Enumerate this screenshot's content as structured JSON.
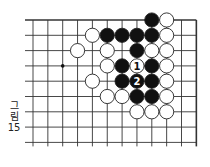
{
  "figure": {
    "caption_lines": [
      "그",
      "림",
      "15"
    ],
    "caption": "그림 15"
  },
  "board": {
    "grid": {
      "x0": 33,
      "y0": 20,
      "dx": 14.85,
      "dy": 15.3,
      "cols": 12,
      "rows": 9,
      "top_edge": true,
      "right_edge": true,
      "line_color": "#333333"
    },
    "star_points": [
      {
        "col": 2,
        "row": 3
      }
    ],
    "stones": [
      {
        "col": 8,
        "row": 0,
        "color": "black"
      },
      {
        "col": 9,
        "row": 0,
        "color": "white"
      },
      {
        "col": 4,
        "row": 1,
        "color": "white"
      },
      {
        "col": 5,
        "row": 1,
        "color": "black"
      },
      {
        "col": 6,
        "row": 1,
        "color": "black"
      },
      {
        "col": 7,
        "row": 1,
        "color": "black"
      },
      {
        "col": 8,
        "row": 1,
        "color": "black"
      },
      {
        "col": 9,
        "row": 1,
        "color": "white"
      },
      {
        "col": 3,
        "row": 2,
        "color": "white"
      },
      {
        "col": 5,
        "row": 2,
        "color": "white"
      },
      {
        "col": 7,
        "row": 2,
        "color": "black"
      },
      {
        "col": 8,
        "row": 2,
        "color": "white"
      },
      {
        "col": 9,
        "row": 2,
        "color": "white"
      },
      {
        "col": 5,
        "row": 3,
        "color": "white"
      },
      {
        "col": 6,
        "row": 3,
        "color": "black"
      },
      {
        "col": 7,
        "row": 3,
        "color": "white",
        "label": "1"
      },
      {
        "col": 8,
        "row": 3,
        "color": "black"
      },
      {
        "col": 9,
        "row": 3,
        "color": "white"
      },
      {
        "col": 4,
        "row": 4,
        "color": "white"
      },
      {
        "col": 6,
        "row": 4,
        "color": "black"
      },
      {
        "col": 7,
        "row": 4,
        "color": "black",
        "label": "2"
      },
      {
        "col": 8,
        "row": 4,
        "color": "black"
      },
      {
        "col": 9,
        "row": 4,
        "color": "white"
      },
      {
        "col": 5,
        "row": 5,
        "color": "white"
      },
      {
        "col": 6,
        "row": 5,
        "color": "white"
      },
      {
        "col": 7,
        "row": 5,
        "color": "black"
      },
      {
        "col": 8,
        "row": 5,
        "color": "black"
      },
      {
        "col": 9,
        "row": 5,
        "color": "white"
      },
      {
        "col": 7,
        "row": 6,
        "color": "white"
      },
      {
        "col": 8,
        "row": 6,
        "color": "white"
      },
      {
        "col": 9,
        "row": 6,
        "color": "white"
      }
    ],
    "colors": {
      "black_stone": "#111111",
      "white_stone": "#ffffff",
      "stone_outline": "#222222",
      "background": "#ffffff"
    }
  }
}
